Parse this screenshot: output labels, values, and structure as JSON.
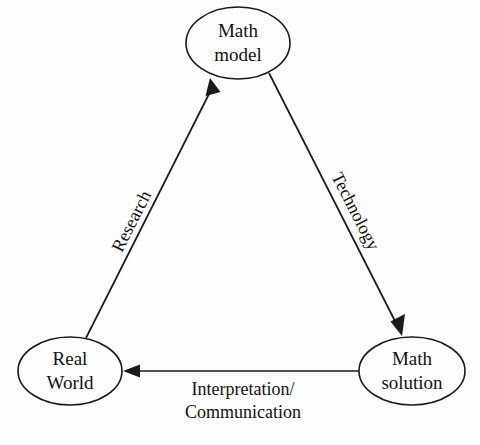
{
  "diagram": {
    "type": "cycle-diagram",
    "background_color": "#fefefe",
    "line_color": "#1a1a1a",
    "text_color": "#111111",
    "nodes": [
      {
        "id": "math-model",
        "line1": "Math",
        "line2": "model",
        "cx": 238,
        "cy": 43,
        "rx": 52,
        "ry": 36
      },
      {
        "id": "real-world",
        "line1": "Real",
        "line2": "World",
        "cx": 70,
        "cy": 371,
        "rx": 52,
        "ry": 34
      },
      {
        "id": "math-solution",
        "line1": "Math",
        "line2": "solution",
        "cx": 412,
        "cy": 371,
        "rx": 53,
        "ry": 34
      }
    ],
    "edges": [
      {
        "id": "research",
        "label": "Research",
        "from": "real-world",
        "to": "math-model",
        "rotation": -63,
        "label_x": 133,
        "label_y": 222
      },
      {
        "id": "technology",
        "label": "Technology",
        "from": "math-model",
        "to": "math-solution",
        "rotation": 63,
        "label_x": 354,
        "label_y": 212
      },
      {
        "id": "interpretation-communication",
        "label_line1": "Interpretation/",
        "label_line2": "Communication",
        "from": "math-solution",
        "to": "real-world",
        "rotation": 0,
        "label_x": 243,
        "label_y": 392
      }
    ]
  }
}
